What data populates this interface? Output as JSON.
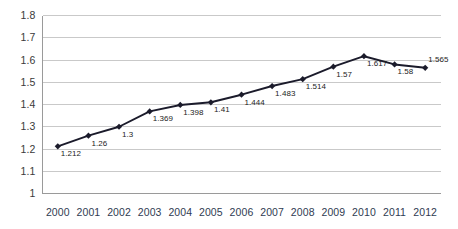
{
  "chart_data": {
    "type": "line",
    "title": "",
    "xlabel": "",
    "ylabel": "",
    "categories": [
      "2000",
      "2001",
      "2002",
      "2003",
      "2004",
      "2005",
      "2006",
      "2007",
      "2008",
      "2009",
      "2010",
      "2011",
      "2012"
    ],
    "values": [
      1.212,
      1.26,
      1.3,
      1.369,
      1.398,
      1.41,
      1.444,
      1.483,
      1.514,
      1.57,
      1.617,
      1.58,
      1.565
    ],
    "point_labels": [
      "1.212",
      "1.26",
      "1.3",
      "1.369",
      "1.398",
      "1.41",
      "1.444",
      "1.483",
      "1.514",
      "1.57",
      "1.617",
      "1.58",
      "1.565"
    ],
    "ylim": [
      1.0,
      1.8
    ],
    "yticks": [
      1.8,
      1.7,
      1.6,
      1.5,
      1.4,
      1.3,
      1.2,
      1.1,
      1.0
    ],
    "ytick_labels": [
      "1.8",
      "1.7",
      "1.6",
      "1.5",
      "1.4",
      "1.3",
      "1.2",
      "1.1",
      "1"
    ],
    "grid": true,
    "grid_axis": "y",
    "legend": "none",
    "marker": "diamond",
    "series_color": "#1b1b2b",
    "grid_color": "#c9c9c9",
    "axis_color": "#9a9a9a",
    "background": "#ffffff",
    "label_color": "#232323",
    "xtick_color": "#2f3b52"
  }
}
